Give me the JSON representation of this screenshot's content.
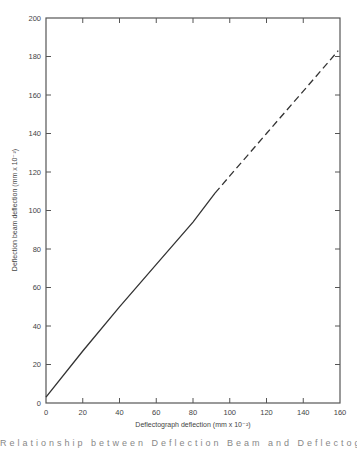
{
  "chart_data": {
    "type": "line",
    "title": "",
    "xlabel": "Deflectograph deflection  (mm x 10⁻²)",
    "ylabel": "Deflection beam deflection (mm x 10⁻²)",
    "xlim": [
      0,
      160
    ],
    "ylim": [
      0,
      200
    ],
    "x_ticks": [
      0,
      20,
      40,
      60,
      80,
      100,
      120,
      140,
      160
    ],
    "y_ticks": [
      0,
      20,
      40,
      60,
      80,
      100,
      120,
      140,
      160,
      180,
      200
    ],
    "grid": false,
    "legend": null,
    "series": [
      {
        "name": "measured relationship",
        "style": "solid",
        "x": [
          0,
          20,
          40,
          60,
          80,
          92
        ],
        "y": [
          3,
          27,
          50,
          72,
          94,
          109
        ]
      },
      {
        "name": "extrapolated relationship",
        "style": "dashed",
        "x": [
          92,
          100,
          120,
          140,
          159
        ],
        "y": [
          109,
          118,
          140,
          162,
          183
        ]
      }
    ],
    "line_color": "#333333",
    "frame_color": "#555555"
  },
  "caption": {
    "text_partial": "Relationship between Deflection Beam and Deflectograph"
  }
}
